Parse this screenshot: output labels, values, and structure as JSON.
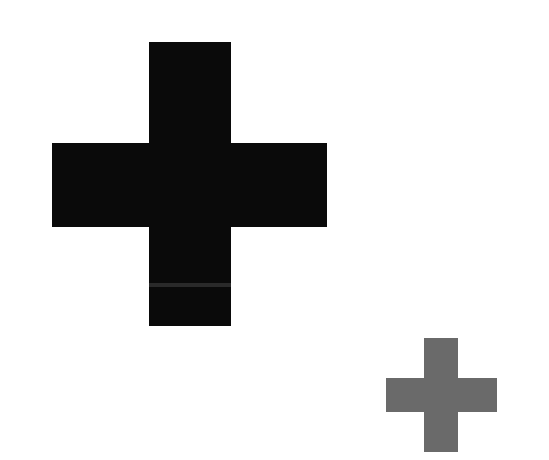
{
  "canvas": {
    "width": 549,
    "height": 460,
    "background": "#ffffff"
  },
  "shapes": [
    {
      "name": "large-plus",
      "color": "#0a0a0a",
      "vertical": {
        "x": 149,
        "y": 42,
        "w": 82,
        "h": 284
      },
      "horizontal": {
        "x": 52,
        "y": 143,
        "w": 275,
        "h": 84
      }
    },
    {
      "name": "small-plus",
      "color": "#6a6a6a",
      "vertical": {
        "x": 424,
        "y": 338,
        "w": 34,
        "h": 114
      },
      "horizontal": {
        "x": 386,
        "y": 378,
        "w": 111,
        "h": 34
      }
    }
  ]
}
